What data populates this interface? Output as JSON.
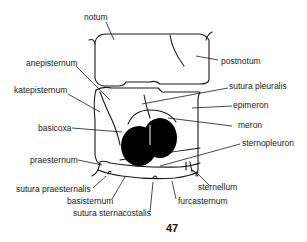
{
  "figure": {
    "number": "47",
    "labels": {
      "notum": "notum",
      "postnotum": "postnotum",
      "anepisternum": "anepisternum",
      "katepisternum": "katepisternum",
      "sutura_pleuralis": "sutura pleuralis",
      "epimeron": "epimeron",
      "basicoxa": "basicoxa",
      "meron": "meron",
      "sternopleuron": "sternopleuron",
      "praesternum": "praesternum",
      "sternellum": "sternellum",
      "sutura_praesternalis": "sutura praesternalis",
      "basisternum": "basisternum",
      "furcasternum": "furcasternum",
      "sutura_sternacostalis": "sutura sternacostalis"
    },
    "colors": {
      "line": "#1a1a1a",
      "fill": "#000000",
      "background": "#ffffff"
    }
  }
}
